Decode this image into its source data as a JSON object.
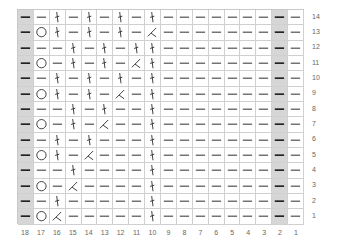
{
  "chart_data": {
    "type": "table",
    "title": "",
    "columns": [
      18,
      17,
      16,
      15,
      14,
      13,
      12,
      11,
      10,
      9,
      8,
      7,
      6,
      5,
      4,
      3,
      2,
      1
    ],
    "row_labels": [
      14,
      13,
      12,
      11,
      10,
      9,
      8,
      7,
      6,
      5,
      4,
      3,
      2,
      1
    ],
    "shaded_columns": [
      18,
      2
    ],
    "legend": {
      "P": "purl (horizontal dash)",
      "O": "yarn over (circle)",
      "T": "twisted stitch (vertical stroke)",
      "D": "decrease (angled stroke)"
    },
    "rows": [
      {
        "row": 14,
        "cells": [
          "P",
          "P",
          "T",
          "P",
          "T",
          "P",
          "T",
          "P",
          "T",
          "P",
          "P",
          "P",
          "P",
          "P",
          "P",
          "P",
          "P",
          "P"
        ]
      },
      {
        "row": 13,
        "cells": [
          "P",
          "O",
          "T",
          "P",
          "T",
          "P",
          "T",
          "P",
          "D",
          "P",
          "P",
          "P",
          "P",
          "P",
          "P",
          "P",
          "P",
          "P"
        ]
      },
      {
        "row": 12,
        "cells": [
          "P",
          "P",
          "P",
          "T",
          "P",
          "T",
          "P",
          "T",
          "T",
          "P",
          "P",
          "P",
          "P",
          "P",
          "P",
          "P",
          "P",
          "P"
        ]
      },
      {
        "row": 11,
        "cells": [
          "P",
          "O",
          "P",
          "T",
          "P",
          "T",
          "P",
          "D",
          "T",
          "P",
          "P",
          "P",
          "P",
          "P",
          "P",
          "P",
          "P",
          "P"
        ]
      },
      {
        "row": 10,
        "cells": [
          "P",
          "P",
          "T",
          "P",
          "T",
          "P",
          "T",
          "P",
          "T",
          "P",
          "P",
          "P",
          "P",
          "P",
          "P",
          "P",
          "P",
          "P"
        ]
      },
      {
        "row": 9,
        "cells": [
          "P",
          "O",
          "T",
          "P",
          "T",
          "P",
          "D",
          "P",
          "T",
          "P",
          "P",
          "P",
          "P",
          "P",
          "P",
          "P",
          "P",
          "P"
        ]
      },
      {
        "row": 8,
        "cells": [
          "P",
          "P",
          "P",
          "T",
          "P",
          "T",
          "P",
          "P",
          "T",
          "P",
          "P",
          "P",
          "P",
          "P",
          "P",
          "P",
          "P",
          "P"
        ]
      },
      {
        "row": 7,
        "cells": [
          "P",
          "O",
          "P",
          "T",
          "P",
          "D",
          "P",
          "P",
          "T",
          "P",
          "P",
          "P",
          "P",
          "P",
          "P",
          "P",
          "P",
          "P"
        ]
      },
      {
        "row": 6,
        "cells": [
          "P",
          "P",
          "T",
          "P",
          "T",
          "P",
          "P",
          "P",
          "T",
          "P",
          "P",
          "P",
          "P",
          "P",
          "P",
          "P",
          "P",
          "P"
        ]
      },
      {
        "row": 5,
        "cells": [
          "P",
          "O",
          "T",
          "P",
          "D",
          "P",
          "P",
          "P",
          "T",
          "P",
          "P",
          "P",
          "P",
          "P",
          "P",
          "P",
          "P",
          "P"
        ]
      },
      {
        "row": 4,
        "cells": [
          "P",
          "P",
          "P",
          "T",
          "P",
          "P",
          "P",
          "P",
          "T",
          "P",
          "P",
          "P",
          "P",
          "P",
          "P",
          "P",
          "P",
          "P"
        ]
      },
      {
        "row": 3,
        "cells": [
          "P",
          "O",
          "P",
          "D",
          "P",
          "P",
          "P",
          "P",
          "T",
          "P",
          "P",
          "P",
          "P",
          "P",
          "P",
          "P",
          "P",
          "P"
        ]
      },
      {
        "row": 2,
        "cells": [
          "P",
          "P",
          "T",
          "P",
          "P",
          "P",
          "P",
          "P",
          "T",
          "P",
          "P",
          "P",
          "P",
          "P",
          "P",
          "P",
          "P",
          "P"
        ]
      },
      {
        "row": 1,
        "cells": [
          "P",
          "O",
          "D",
          "P",
          "P",
          "P",
          "P",
          "P",
          "T",
          "P",
          "P",
          "P",
          "P",
          "P",
          "P",
          "P",
          "P",
          "P"
        ]
      }
    ]
  },
  "colors": {
    "shaded": "#d6d6d6",
    "grid_line": "#d0d0d0",
    "symbol": "#333333",
    "symbol_shaded": "#222222",
    "label": "#666666"
  }
}
